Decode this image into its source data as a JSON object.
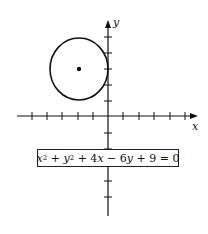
{
  "diagram": {
    "type": "coordinate-plane-circle",
    "axes": {
      "x_label": "x",
      "y_label": "y",
      "x_ticks_left": 5,
      "x_ticks_right": 5,
      "y_ticks_up": 5,
      "y_ticks_down": 5
    },
    "circle": {
      "center": [
        -2,
        3
      ],
      "radius": 2,
      "center_marked": true
    },
    "equation": {
      "x_term": "x",
      "x_exp": "2",
      "plus1": " + ",
      "y_term": "y",
      "y_exp": "2",
      "rest_a": " + 4",
      "x2": "x",
      "rest_b": " − 6",
      "y2": "y",
      "rest_c": " + 9 = 0",
      "full_text": "x² + y² + 4x − 6y + 9 = 0"
    },
    "colors": {
      "stroke": "#111111",
      "background": "#ffffff"
    }
  }
}
